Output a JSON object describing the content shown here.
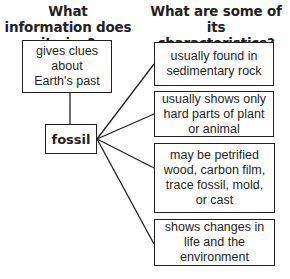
{
  "headings": {
    "left": "What information does it give?",
    "right": "What are some of its characteristics?"
  },
  "center_node": {
    "label": "fossil"
  },
  "info_node": {
    "text": "gives clues about Earth's past"
  },
  "characteristics": [
    {
      "text": "usually found in sedimentary rock"
    },
    {
      "text": "usually shows only hard parts of plant or animal"
    },
    {
      "text": "may be petrified wood, carbon film, trace fossil, mold, or cast"
    },
    {
      "text": "shows changes in life and the environment"
    }
  ],
  "colors": {
    "line": "#231f20",
    "background": "#ffffff"
  }
}
